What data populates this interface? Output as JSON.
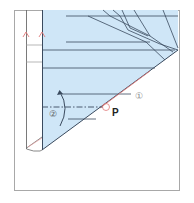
{
  "diagram": {
    "type": "origami-fold-step",
    "labels": {
      "point": "P",
      "step1": "①",
      "step2": "②"
    },
    "colors": {
      "paper_blue": "#cfe6f7",
      "line": "#3a4a5e",
      "red_mark": "#e07a7a",
      "frame": "#9a9a9a"
    },
    "annotations": [
      {
        "id": "step1",
        "text": "①",
        "meaning": "valley fold along red edge"
      },
      {
        "id": "step2",
        "text": "②",
        "meaning": "fold up along dash-dot line"
      },
      {
        "id": "point",
        "text": "P",
        "meaning": "reference point"
      }
    ]
  }
}
